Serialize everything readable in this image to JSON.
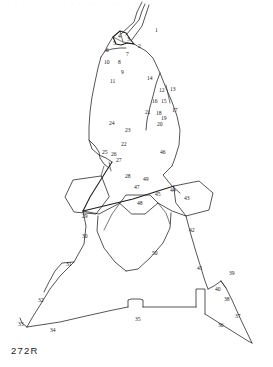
{
  "figure": {
    "plate_caption": "272R",
    "top_bleed_text": "·    ·        ·              ·            ·      ·   ·  ·  ·· ·  ·· ·· ·· ·· ·· ··· ·",
    "title_alt": "Numbered flake-scar diagram of a bifacial lithic artifact",
    "stroke_color": "#1d1d1d",
    "background_color": "#ffffff",
    "label_color": "#1a1a1a"
  },
  "labels": [
    {
      "id": "1",
      "text": "1",
      "x": 155,
      "y": 28
    },
    {
      "id": "2",
      "text": "2",
      "x": 138,
      "y": 44
    },
    {
      "id": "3",
      "text": "3",
      "x": 127,
      "y": 37
    },
    {
      "id": "4",
      "text": "4",
      "x": 118,
      "y": 34
    },
    {
      "id": "5",
      "text": "5",
      "x": 113,
      "y": 41
    },
    {
      "id": "6",
      "text": "6",
      "x": 106,
      "y": 48
    },
    {
      "id": "7",
      "text": "7",
      "x": 126,
      "y": 52
    },
    {
      "id": "8",
      "text": "8",
      "x": 118,
      "y": 60
    },
    {
      "id": "9",
      "text": "9",
      "x": 121,
      "y": 70
    },
    {
      "id": "10",
      "text": "10",
      "x": 104,
      "y": 60
    },
    {
      "id": "11",
      "text": "11",
      "x": 110,
      "y": 79
    },
    {
      "id": "12",
      "text": "12",
      "x": 159,
      "y": 88
    },
    {
      "id": "13",
      "text": "13",
      "x": 170,
      "y": 87
    },
    {
      "id": "14",
      "text": "14",
      "x": 147,
      "y": 76
    },
    {
      "id": "15",
      "text": "15",
      "x": 161,
      "y": 99
    },
    {
      "id": "16",
      "text": "16",
      "x": 152,
      "y": 99
    },
    {
      "id": "17",
      "text": "17",
      "x": 172,
      "y": 108
    },
    {
      "id": "18",
      "text": "18",
      "x": 156,
      "y": 111
    },
    {
      "id": "19",
      "text": "19",
      "x": 161,
      "y": 116
    },
    {
      "id": "20",
      "text": "20",
      "x": 157,
      "y": 122
    },
    {
      "id": "21",
      "text": "21",
      "x": 145,
      "y": 110
    },
    {
      "id": "22",
      "text": "22",
      "x": 121,
      "y": 142
    },
    {
      "id": "23",
      "text": "23",
      "x": 125,
      "y": 128
    },
    {
      "id": "24",
      "text": "24",
      "x": 109,
      "y": 121
    },
    {
      "id": "25",
      "text": "25",
      "x": 102,
      "y": 150
    },
    {
      "id": "26",
      "text": "26",
      "x": 111,
      "y": 152
    },
    {
      "id": "27",
      "text": "27",
      "x": 116,
      "y": 158
    },
    {
      "id": "28",
      "text": "28",
      "x": 125,
      "y": 174
    },
    {
      "id": "29",
      "text": "29",
      "x": 82,
      "y": 214
    },
    {
      "id": "30",
      "text": "30",
      "x": 82,
      "y": 234
    },
    {
      "id": "31",
      "text": "31",
      "x": 66,
      "y": 262
    },
    {
      "id": "32",
      "text": "32",
      "x": 38,
      "y": 298
    },
    {
      "id": "33",
      "text": "33",
      "x": 18,
      "y": 322
    },
    {
      "id": "34",
      "text": "34",
      "x": 50,
      "y": 328
    },
    {
      "id": "35",
      "text": "35",
      "x": 135,
      "y": 317
    },
    {
      "id": "36",
      "text": "36",
      "x": 218,
      "y": 323
    },
    {
      "id": "37",
      "text": "37",
      "x": 235,
      "y": 314
    },
    {
      "id": "38",
      "text": "38",
      "x": 224,
      "y": 297
    },
    {
      "id": "39",
      "text": "39",
      "x": 229,
      "y": 271
    },
    {
      "id": "40",
      "text": "40",
      "x": 215,
      "y": 287
    },
    {
      "id": "41",
      "text": "41",
      "x": 197,
      "y": 266
    },
    {
      "id": "42",
      "text": "42",
      "x": 189,
      "y": 228
    },
    {
      "id": "43",
      "text": "43",
      "x": 184,
      "y": 196
    },
    {
      "id": "44",
      "text": "44",
      "x": 170,
      "y": 188
    },
    {
      "id": "45",
      "text": "45",
      "x": 155,
      "y": 192
    },
    {
      "id": "46",
      "text": "46",
      "x": 160,
      "y": 150
    },
    {
      "id": "47",
      "text": "47",
      "x": 134,
      "y": 185
    },
    {
      "id": "48",
      "text": "48",
      "x": 137,
      "y": 201
    },
    {
      "id": "49",
      "text": "49",
      "x": 143,
      "y": 177
    },
    {
      "id": "50",
      "text": "50",
      "x": 152,
      "y": 251
    }
  ],
  "paths": [
    {
      "name": "tip-blade-right-long",
      "weight": "thin",
      "d": "M 121 34 L 134 22 L 137 12 L 140 6 L 142 2"
    },
    {
      "name": "tip-blade-right-long-b",
      "weight": "thin",
      "d": "M 126 35 L 139 20 L 142 11 L 145 4"
    },
    {
      "name": "tip-blade-inner",
      "weight": "thin",
      "d": "M 131 41 L 142 26 L 146 14 L 149 5"
    },
    {
      "name": "tip-arrow-notch",
      "weight": "med",
      "d": "M 113 37 L 120 31 L 126 33 L 130 39 L 134 44 L 127 43 L 121 45 L 116 44 Z"
    },
    {
      "name": "tip-arrow-inner-a",
      "weight": "hair",
      "d": "M 113 37 L 123 42 L 134 44"
    },
    {
      "name": "tip-arrow-inner-b",
      "weight": "hair",
      "d": "M 120 31 L 123 42"
    },
    {
      "name": "shoulder-left-upper",
      "weight": "thin",
      "d": "M 113 37 L 108 45 L 105 51 L 101 57"
    },
    {
      "name": "shoulder-left-lower",
      "weight": "thin",
      "d": "M 105 51 L 112 49 L 120 48 L 126 48"
    },
    {
      "name": "body-outline-right",
      "weight": "thin",
      "d": "M 134 44 L 146 51 L 153 58 L 160 73 L 166 88 L 172 102 L 177 116 L 180 130 L 179 145 L 175 158 L 172 166"
    },
    {
      "name": "body-outline-left",
      "weight": "thin",
      "d": "M 101 57 L 98 68 L 95 82 L 92 97 L 90 112 L 89 127 L 89 140 L 92 149 L 99 155 L 106 158 L 112 162"
    },
    {
      "name": "left-notch-step",
      "weight": "thin",
      "d": "M 89 140 L 95 146 L 99 152 L 100 158 L 104 164 L 109 168"
    },
    {
      "name": "midline-scar-long",
      "weight": "thin",
      "d": "M 160 73 L 156 84 L 153 96 L 150 107 L 147 120 L 146 130"
    },
    {
      "name": "scar-12-13-div",
      "weight": "hair",
      "d": "M 166 85 L 168 94 L 170 103"
    },
    {
      "name": "left-facet-tick-a",
      "weight": "hair",
      "d": "M 109 162 L 111 171"
    },
    {
      "name": "left-facet-tick-b",
      "weight": "hair",
      "d": "M 104 166 L 101 176"
    },
    {
      "name": "left-pentagon",
      "weight": "thin",
      "d": "M 101 176 L 73 180 L 65 197 L 74 212 L 96 214 L 109 197 Z"
    },
    {
      "name": "big-diagonal-left",
      "weight": "med",
      "d": "M 112 162 L 100 181 L 90 197 L 83 211"
    },
    {
      "name": "big-diagonal-to-center",
      "weight": "med",
      "d": "M 83 211 L 108 205 L 133 199 L 158 191 L 174 186"
    },
    {
      "name": "center-upper-v",
      "weight": "thin",
      "d": "M 172 166 L 163 175 L 172 186 L 180 193"
    },
    {
      "name": "right-pentagon",
      "weight": "thin",
      "d": "M 174 186 L 199 181 L 213 193 L 209 210 L 186 216 L 176 203 Z"
    },
    {
      "name": "center-trapezoid-48",
      "weight": "thin",
      "d": "M 120 203 L 126 195 L 150 195 L 158 203 L 145 214 L 132 214 Z"
    },
    {
      "name": "ridge-left-down",
      "weight": "thin",
      "d": "M 83 211 L 99 214 L 120 203"
    },
    {
      "name": "ridge-right-down",
      "weight": "thin",
      "d": "M 158 203 L 172 211 L 186 216"
    },
    {
      "name": "lower-blade-left",
      "weight": "thin",
      "d": "M 98 216 L 97 231 L 104 248 L 115 262 L 126 271"
    },
    {
      "name": "lower-blade-right",
      "weight": "thin",
      "d": "M 171 213 L 170 228 L 163 243 L 150 258 L 138 269 L 126 271"
    },
    {
      "name": "lower-blade-inner-l",
      "weight": "hair",
      "d": "M 120 203 L 112 214 L 104 230"
    },
    {
      "name": "lower-blade-inner-r",
      "weight": "hair",
      "d": "M 158 203 L 166 213 L 170 224"
    },
    {
      "name": "stem-left-edge",
      "weight": "thin",
      "d": "M 83 211 L 86 226 L 84 244 L 74 262 L 60 276 L 50 289 L 42 302 L 32 318 L 27 327"
    },
    {
      "name": "stem-left-jog",
      "weight": "thin",
      "d": "M 74 262 L 62 263 L 55 271 L 49 282 L 44 292"
    },
    {
      "name": "base-left-foot",
      "weight": "thin",
      "d": "M 27 327 L 22 323 L 20 318"
    },
    {
      "name": "base-line-left",
      "weight": "thin",
      "d": "M 27 327 L 60 322 L 86 316 L 113 310 L 128 307"
    },
    {
      "name": "base-notch",
      "weight": "thin",
      "d": "M 128 307 L 128 300 L 131 299 L 140 299 L 143 300 L 143 307"
    },
    {
      "name": "base-line-right",
      "weight": "thin",
      "d": "M 143 307 L 170 307 L 190 307 L 196 307"
    },
    {
      "name": "base-step-right",
      "weight": "thin",
      "d": "M 196 307 L 196 289 L 205 289 L 205 305 L 205 314"
    },
    {
      "name": "base-bottom-right",
      "weight": "thin",
      "d": "M 205 314 L 232 331 L 248 341 L 252 343"
    },
    {
      "name": "right-tail-up",
      "weight": "thin",
      "d": "M 252 343 L 241 320 L 232 300 L 226 288 L 221 281"
    },
    {
      "name": "right-tail-peak",
      "weight": "thin",
      "d": "M 221 281 L 214 286 L 208 289"
    },
    {
      "name": "right-upper-tail",
      "weight": "thin",
      "d": "M 186 216 L 191 235 L 196 252 L 201 268 L 205 281 L 208 289"
    },
    {
      "name": "right-tail-39-edge",
      "weight": "hair",
      "d": "M 221 281 L 226 288"
    }
  ]
}
